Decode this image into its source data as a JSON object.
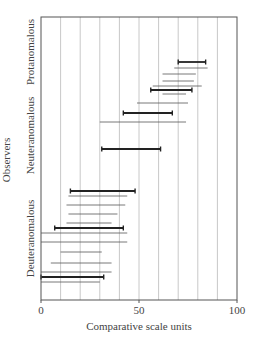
{
  "chart_data": {
    "type": "range_bar",
    "title": "",
    "xlabel": "Comparative scale units",
    "ylabel": "Observers",
    "xlim": [
      0,
      100
    ],
    "x_ticks": [
      0,
      50,
      100
    ],
    "x_tick_labels": [
      "0",
      "50",
      "100"
    ],
    "grid": {
      "vertical": true,
      "step": 10
    },
    "groups": [
      {
        "name": "Protanomalous",
        "y_span_px": [
          12,
          92
        ]
      },
      {
        "name": "Neuteranomalous",
        "y_span_px": [
          95,
          176
        ]
      },
      {
        "name": "Deuteranomalous",
        "y_span_px": [
          190,
          287
        ]
      }
    ],
    "ranges": [
      {
        "start": 70,
        "end": 84,
        "bold": true,
        "y_px": 62
      },
      {
        "start": 68,
        "end": 85,
        "bold": false,
        "y_px": 68
      },
      {
        "start": 62,
        "end": 79,
        "bold": false,
        "y_px": 74
      },
      {
        "start": 62,
        "end": 78,
        "bold": false,
        "y_px": 81
      },
      {
        "start": 57,
        "end": 82,
        "bold": false,
        "y_px": 86
      },
      {
        "start": 56,
        "end": 77,
        "bold": true,
        "y_px": 90
      },
      {
        "start": 62,
        "end": 74,
        "bold": false,
        "y_px": 94
      },
      {
        "start": 49,
        "end": 75,
        "bold": false,
        "y_px": 103
      },
      {
        "start": 42,
        "end": 67,
        "bold": true,
        "y_px": 113
      },
      {
        "start": 30,
        "end": 74,
        "bold": false,
        "y_px": 122
      },
      {
        "start": 31,
        "end": 61,
        "bold": true,
        "y_px": 149
      },
      {
        "start": 15,
        "end": 48,
        "bold": true,
        "y_px": 191
      },
      {
        "start": 14,
        "end": 44,
        "bold": false,
        "y_px": 196
      },
      {
        "start": 13,
        "end": 43,
        "bold": false,
        "y_px": 205
      },
      {
        "start": 14,
        "end": 39,
        "bold": false,
        "y_px": 214
      },
      {
        "start": 13,
        "end": 36,
        "bold": false,
        "y_px": 223
      },
      {
        "start": 7,
        "end": 42,
        "bold": true,
        "y_px": 228
      },
      {
        "start": 0,
        "end": 44,
        "bold": false,
        "y_px": 233
      },
      {
        "start": 0,
        "end": 44,
        "bold": false,
        "y_px": 242
      },
      {
        "start": 10,
        "end": 31,
        "bold": false,
        "y_px": 252
      },
      {
        "start": 5,
        "end": 36,
        "bold": false,
        "y_px": 263
      },
      {
        "start": 0,
        "end": 36,
        "bold": false,
        "y_px": 272
      },
      {
        "start": 0,
        "end": 32,
        "bold": true,
        "y_px": 277
      },
      {
        "start": 0,
        "end": 30,
        "bold": false,
        "y_px": 282
      }
    ],
    "legend": null
  },
  "colors": {
    "frame": "#555555",
    "grid": "#c8c8c8",
    "bold_bar": "#222222",
    "thin_bar": "#555555"
  },
  "layout": {
    "plot_left": 41,
    "plot_right": 237,
    "plot_top": 17,
    "plot_bottom": 300
  }
}
